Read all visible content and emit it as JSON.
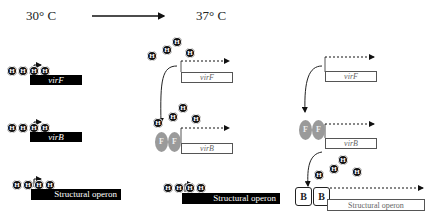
{
  "header": {
    "temp_left": "30° C",
    "temp_right": "37° C",
    "transition_arrow": "arrow-right-icon"
  },
  "labels": {
    "h_protein": "H",
    "f_protein": "F",
    "b_protein": "B"
  },
  "panels": [
    {
      "name": "30C-repressed",
      "rows": [
        {
          "gene": "virF",
          "state": "repressed"
        },
        {
          "gene": "virB",
          "state": "repressed"
        },
        {
          "gene": "Structural operon",
          "state": "repressed"
        }
      ]
    },
    {
      "name": "37C-virF-active",
      "rows": [
        {
          "gene": "virF",
          "state": "transcribed"
        },
        {
          "gene": "virB",
          "state": "transcribed"
        },
        {
          "gene": "Structural operon",
          "state": "repressed"
        }
      ]
    },
    {
      "name": "37C-full-activation",
      "rows": [
        {
          "gene": "virF",
          "state": "transcribed"
        },
        {
          "gene": "virB",
          "state": "transcribed"
        },
        {
          "gene": "Structural operon",
          "state": "transcribed"
        }
      ]
    }
  ],
  "colors": {
    "repressed_bar": "#000000",
    "active_box_border": "#555555",
    "f_protein": "#9a9a9a",
    "h_protein": "#111111"
  }
}
